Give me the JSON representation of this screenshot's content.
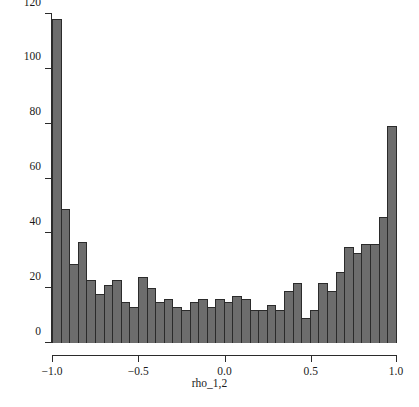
{
  "chart_data": {
    "type": "bar",
    "title": "",
    "subtitle": "",
    "xlabel": "rho_1,2",
    "ylabel": "",
    "xlim": [
      -1.0,
      1.0
    ],
    "ylim": [
      0,
      120
    ],
    "grid": false,
    "legend": null,
    "bin_width": 0.05,
    "n_bins": 40,
    "bar_color": "#6d6d6d",
    "bar_edge_color": "#2b2b2b",
    "axis_color": "#2b2b2b",
    "background_color": "#ffffff",
    "x_ticks": [
      -1.0,
      -0.5,
      0.0,
      0.5,
      1.0
    ],
    "x_tick_labels": [
      "−1.0",
      "−0.5",
      "0.0",
      "0.5",
      "1.0"
    ],
    "y_ticks": [
      0,
      20,
      40,
      60,
      80,
      100,
      120
    ],
    "y_tick_labels": [
      "0",
      "20",
      "40",
      "60",
      "80",
      "100",
      "120"
    ],
    "bin_centers": [
      -0.975,
      -0.925,
      -0.875,
      -0.825,
      -0.775,
      -0.725,
      -0.675,
      -0.625,
      -0.575,
      -0.525,
      -0.475,
      -0.425,
      -0.375,
      -0.325,
      -0.275,
      -0.225,
      -0.175,
      -0.125,
      -0.075,
      -0.025,
      0.025,
      0.075,
      0.125,
      0.175,
      0.225,
      0.275,
      0.325,
      0.375,
      0.425,
      0.475,
      0.525,
      0.575,
      0.625,
      0.675,
      0.725,
      0.775,
      0.825,
      0.875,
      0.925,
      0.975
    ],
    "categories": [
      "-1.00 to -0.95",
      "-0.95 to -0.90",
      "-0.90 to -0.85",
      "-0.85 to -0.80",
      "-0.80 to -0.75",
      "-0.75 to -0.70",
      "-0.70 to -0.65",
      "-0.65 to -0.60",
      "-0.60 to -0.55",
      "-0.55 to -0.50",
      "-0.50 to -0.45",
      "-0.45 to -0.40",
      "-0.40 to -0.35",
      "-0.35 to -0.30",
      "-0.30 to -0.25",
      "-0.25 to -0.20",
      "-0.20 to -0.15",
      "-0.15 to -0.10",
      "-0.10 to -0.05",
      "-0.05 to 0.00",
      "0.00 to 0.05",
      "0.05 to 0.10",
      "0.10 to 0.15",
      "0.15 to 0.20",
      "0.20 to 0.25",
      "0.25 to 0.30",
      "0.30 to 0.35",
      "0.35 to 0.40",
      "0.40 to 0.45",
      "0.45 to 0.50",
      "0.50 to 0.55",
      "0.55 to 0.60",
      "0.60 to 0.65",
      "0.65 to 0.70",
      "0.70 to 0.75",
      "0.75 to 0.80",
      "0.80 to 0.85",
      "0.85 to 0.90",
      "0.90 to 0.95",
      "0.95 to 1.00"
    ],
    "values": [
      118,
      49,
      29,
      37,
      23,
      18,
      21,
      23,
      15,
      13,
      24,
      20,
      15,
      16,
      13,
      12,
      15,
      16,
      13,
      16,
      15,
      17,
      16,
      12,
      12,
      14,
      12,
      19,
      22,
      9,
      12,
      22,
      19,
      26,
      35,
      33,
      36,
      36,
      46,
      79
    ]
  }
}
